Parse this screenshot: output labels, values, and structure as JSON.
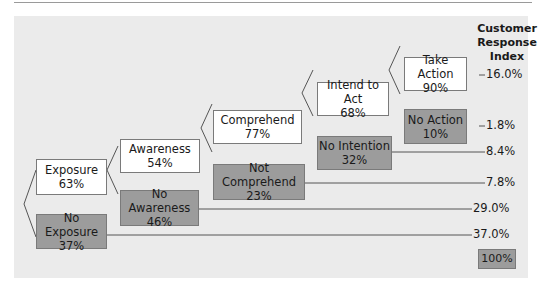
{
  "header": {
    "line1": "Customer",
    "line2": "Response",
    "line3": "Index"
  },
  "nodes": {
    "exposure": {
      "label": "Exposure",
      "pct": "63%"
    },
    "no_exposure": {
      "label": "No Exposure",
      "pct": "37%"
    },
    "awareness": {
      "label": "Awareness",
      "pct": "54%"
    },
    "no_awareness": {
      "label": "No Awareness",
      "pct": "46%"
    },
    "comprehend": {
      "label": "Comprehend",
      "pct": "77%"
    },
    "not_comprehend": {
      "label": "Not Comprehend",
      "pct": "23%"
    },
    "intend": {
      "label": "Intend to Act",
      "pct": "68%"
    },
    "no_intention": {
      "label": "No Intention",
      "pct": "32%"
    },
    "take_action": {
      "label": "Take Action",
      "pct": "90%"
    },
    "no_action": {
      "label": "No Action",
      "pct": "10%"
    }
  },
  "index_values": {
    "take_action": "16.0%",
    "no_action": "1.8%",
    "no_intention": "8.4%",
    "not_comprehend": "7.8%",
    "no_awareness": "29.0%",
    "no_exposure": "37.0%"
  },
  "total": "100%",
  "colors": {
    "panel": "#ebebeb",
    "positive_box": "#ffffff",
    "negative_box": "#9c9c9c",
    "line": "#555555"
  }
}
